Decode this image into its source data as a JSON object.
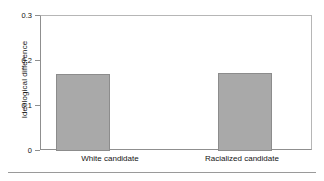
{
  "chart_data": {
    "type": "bar",
    "title": "",
    "xlabel": "",
    "ylabel": "Ideological difference",
    "categories": [
      "White candidate",
      "Racialized candidate"
    ],
    "values": [
      0.172,
      0.174
    ],
    "ylim": [
      0,
      0.3
    ],
    "yticks": [
      0,
      0.1,
      0.2,
      0.3
    ],
    "ytick_labels": [
      "0",
      "0.1",
      "0.2",
      "0.3"
    ],
    "grid": false,
    "legend": null,
    "bar_color": "#a9a9a9",
    "bar_edge_color": "#8c8c8c",
    "axis_color": "#8f8f8f",
    "background": "#ffffff"
  }
}
